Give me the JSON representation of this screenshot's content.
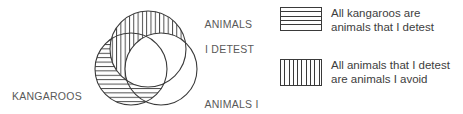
{
  "figure": {
    "type": "venn-diagram",
    "title": "",
    "circles": [
      {
        "id": "detest",
        "label": "ANIMALS\nI DETEST",
        "fill_pattern": "vertical-stripes",
        "position": "top"
      },
      {
        "id": "kangaroos",
        "label": "KANGAROOS",
        "fill_pattern": "horizontal-stripes",
        "position": "lower-left"
      },
      {
        "id": "avoid",
        "label": "ANIMALS I\nAVOID",
        "fill_pattern": "none",
        "position": "lower-right"
      }
    ],
    "labels": {
      "kangaroos": "KANGAROOS",
      "detest_line1": "ANIMALS",
      "detest_line2": "I DETEST",
      "avoid_line1": "ANIMALS I",
      "avoid_line2": "AVOID"
    }
  },
  "legend": {
    "items": [
      {
        "swatch": "horizontal-stripes",
        "text": "All kangaroos are\nanimals that I detest"
      },
      {
        "swatch": "vertical-stripes",
        "text": "All animals that I detest\nare animals I avoid"
      }
    ]
  },
  "colors": {
    "stroke": "#3a3a3a",
    "label_text": "#595959",
    "legend_text": "#3d3d3d",
    "background": "#ffffff"
  }
}
